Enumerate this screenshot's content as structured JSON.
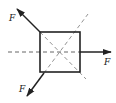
{
  "diagram": {
    "type": "force-diagram",
    "colors": {
      "line": "#222222",
      "dashed": "#555555",
      "background": "#ffffff"
    },
    "square": {
      "x": 40,
      "y": 32,
      "size": 40
    },
    "forces": [
      {
        "id": "upper-left",
        "label": "F",
        "from": [
          40,
          32
        ],
        "to": [
          17,
          9
        ],
        "label_pos": [
          9,
          21
        ]
      },
      {
        "id": "right",
        "label": "F",
        "from": [
          80,
          52
        ],
        "to": [
          111,
          52
        ],
        "label_pos": [
          104,
          65
        ]
      },
      {
        "id": "lower-left",
        "label": "F",
        "from": [
          44,
          73
        ],
        "to": [
          27,
          96
        ],
        "label_pos": [
          19,
          92
        ]
      }
    ],
    "reference_lines": [
      {
        "id": "horizontal-axis",
        "from": [
          8,
          52
        ],
        "to": [
          80,
          52
        ],
        "style": "dashed"
      },
      {
        "id": "diagonal-rising",
        "from": [
          44,
          73
        ],
        "to": [
          88,
          14
        ],
        "style": "dashed"
      },
      {
        "id": "diagonal-falling",
        "from": [
          40,
          32
        ],
        "to": [
          86,
          79
        ],
        "style": "dashed"
      }
    ]
  }
}
